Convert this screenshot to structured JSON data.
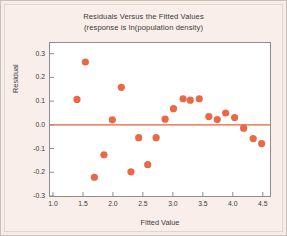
{
  "chart_data": {
    "type": "scatter",
    "title": "Residuals Versus the Fitted Values",
    "subtitle": "(response is ln(population density)",
    "xlabel": "Fitted Value",
    "ylabel": "Residual",
    "xlim": [
      0.95,
      4.62
    ],
    "ylim": [
      -0.3,
      0.345
    ],
    "xticks": [
      "1.0",
      "1.5",
      "2.0",
      "2.5",
      "3.0",
      "3.5",
      "4.0",
      "4.5"
    ],
    "xtick_values": [
      1.0,
      1.5,
      2.0,
      2.5,
      3.0,
      3.5,
      4.0,
      4.5
    ],
    "yticks": [
      "0.3",
      "0.2",
      "0.1",
      "0.0",
      "-0.1",
      "-0.2",
      "-0.3"
    ],
    "ytick_values": [
      0.3,
      0.2,
      0.1,
      0.0,
      -0.1,
      -0.2,
      -0.3
    ],
    "grid": false,
    "legend": null,
    "reference_line": {
      "y": 0.0,
      "color": "#e8613c"
    },
    "marker": {
      "shape": "circle",
      "color": "#e8613c",
      "size": 4.6
    },
    "points": [
      {
        "x": 1.4,
        "y": 0.107
      },
      {
        "x": 1.54,
        "y": 0.265
      },
      {
        "x": 1.69,
        "y": -0.221
      },
      {
        "x": 1.85,
        "y": -0.126
      },
      {
        "x": 1.99,
        "y": 0.021
      },
      {
        "x": 2.14,
        "y": 0.158
      },
      {
        "x": 2.3,
        "y": -0.198
      },
      {
        "x": 2.43,
        "y": -0.054
      },
      {
        "x": 2.58,
        "y": -0.168
      },
      {
        "x": 2.72,
        "y": -0.054
      },
      {
        "x": 2.87,
        "y": 0.024
      },
      {
        "x": 3.01,
        "y": 0.068
      },
      {
        "x": 3.17,
        "y": 0.11
      },
      {
        "x": 3.29,
        "y": 0.104
      },
      {
        "x": 3.44,
        "y": 0.11
      },
      {
        "x": 3.6,
        "y": 0.035
      },
      {
        "x": 3.74,
        "y": 0.022
      },
      {
        "x": 3.88,
        "y": 0.05
      },
      {
        "x": 4.03,
        "y": 0.031
      },
      {
        "x": 4.18,
        "y": -0.014
      },
      {
        "x": 4.34,
        "y": -0.058
      },
      {
        "x": 4.48,
        "y": -0.079
      }
    ]
  }
}
